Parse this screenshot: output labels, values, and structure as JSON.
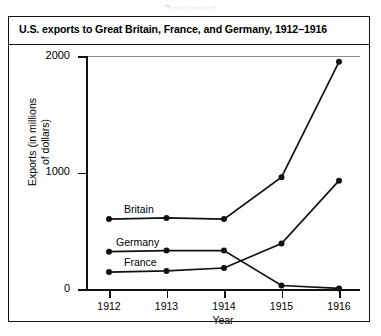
{
  "clipped_header": "Document",
  "chart_data": {
    "type": "line",
    "title": "U.S. exports to Great Britain, France, and Germany, 1912–1916",
    "xlabel": "Year",
    "ylabel": "Exports (in millions of dollars)",
    "ylabel_line1": "Exports (in millions",
    "ylabel_line2": "of dollars)",
    "categories": [
      "1912",
      "1913",
      "1914",
      "1915",
      "1916"
    ],
    "x": [
      1912,
      1913,
      1914,
      1915,
      1916
    ],
    "xlim": [
      1912,
      1916
    ],
    "ylim": [
      0,
      2000
    ],
    "yticks": [
      0,
      1000,
      2000
    ],
    "ytick_labels": [
      "0",
      "1000",
      "2000"
    ],
    "grid": false,
    "legend": "inline-labels",
    "series": [
      {
        "name": "Britain",
        "values": [
          600,
          610,
          600,
          960,
          1950
        ]
      },
      {
        "name": "Germany",
        "values": [
          320,
          330,
          330,
          30,
          5
        ]
      },
      {
        "name": "France",
        "values": [
          145,
          155,
          180,
          390,
          930
        ]
      }
    ],
    "annotations": [
      {
        "text": "Britain",
        "at_year": 1912,
        "value": 600
      },
      {
        "text": "Germany",
        "at_year": 1912,
        "value": 320
      },
      {
        "text": "France",
        "at_year": 1912,
        "value": 145
      }
    ]
  }
}
